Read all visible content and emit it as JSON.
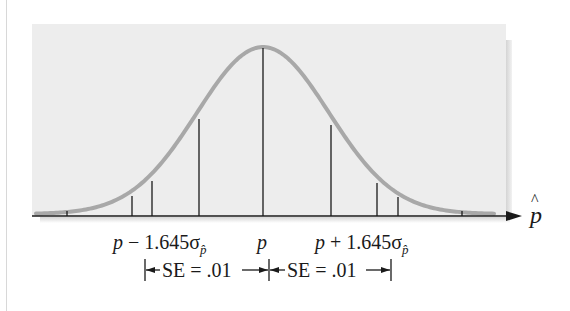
{
  "diagram": {
    "axis_label": "p̂",
    "axis_label_base": "p",
    "axis_label_hat": "^",
    "labels": {
      "left": {
        "prefix": "p",
        "op": " − 1.645σ",
        "sub": "p̂"
      },
      "center": "p",
      "right": {
        "prefix": "p",
        "op": " + 1.645σ",
        "sub": "p̂"
      }
    },
    "se_brackets": [
      {
        "text": "SE = .01"
      },
      {
        "text": "SE = .01"
      }
    ],
    "colors": {
      "panel": "#ededed",
      "curve": "#a8a8a8",
      "lines": "#1a1a1a",
      "shadow": "#d4d4d4"
    },
    "curve": {
      "type": "normal",
      "mean_x": 263,
      "peak_y": 47,
      "baseline_y": 214,
      "sigma_px": 66
    },
    "vertical_lines": [
      {
        "x": 67,
        "top": 211
      },
      {
        "x": 132,
        "top": 196
      },
      {
        "x": 152,
        "top": 181
      },
      {
        "x": 199,
        "top": 119
      },
      {
        "x": 263,
        "top": 48
      },
      {
        "x": 331,
        "top": 125
      },
      {
        "x": 377,
        "top": 183
      },
      {
        "x": 398,
        "top": 197
      },
      {
        "x": 462,
        "top": 211
      }
    ]
  }
}
